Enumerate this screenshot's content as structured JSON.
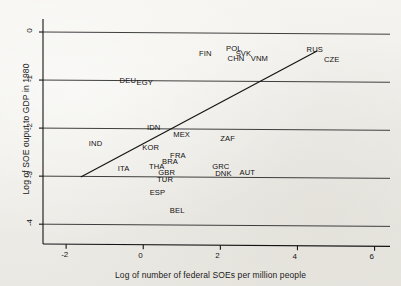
{
  "chart_data": {
    "type": "scatter",
    "title": "",
    "xlabel": "Log of number of federal SOEs per million people",
    "ylabel": "Log of SOE ouput to GDP in 1980",
    "xlim": [
      -2.6,
      6.4
    ],
    "ylim": [
      -4.35,
      0.25
    ],
    "xticks": [
      -2,
      0,
      2,
      4,
      6
    ],
    "xticklabels": [
      "-2",
      "0",
      "2",
      "4",
      "6"
    ],
    "yticks": [
      0,
      -1,
      -2,
      -3,
      -4
    ],
    "yticklabels": [
      "0",
      "-1",
      "-2",
      "-3",
      "-4"
    ],
    "grid": "horizontal",
    "legend": "none",
    "point_style": "text-label",
    "points": [
      {
        "label": "FIN",
        "x": 1.68,
        "y": -0.46
      },
      {
        "label": "POL",
        "x": 2.38,
        "y": -0.35
      },
      {
        "label": "SVK",
        "x": 2.63,
        "y": -0.45
      },
      {
        "label": "CHN",
        "x": 2.42,
        "y": -0.56
      },
      {
        "label": "VNM",
        "x": 3.02,
        "y": -0.56
      },
      {
        "label": "RUS",
        "x": 4.47,
        "y": -0.37
      },
      {
        "label": "CZE",
        "x": 4.92,
        "y": -0.58
      },
      {
        "label": "DEU",
        "x": -0.38,
        "y": -1.03
      },
      {
        "label": "EGY",
        "x": 0.06,
        "y": -1.06
      },
      {
        "label": "IDN",
        "x": 0.33,
        "y": -1.99
      },
      {
        "label": "MEX",
        "x": 1.01,
        "y": -2.15
      },
      {
        "label": "ZAF",
        "x": 2.23,
        "y": -2.23
      },
      {
        "label": "IND",
        "x": -1.18,
        "y": -2.33
      },
      {
        "label": "KOR",
        "x": 0.21,
        "y": -2.42
      },
      {
        "label": "FRA",
        "x": 0.93,
        "y": -2.58
      },
      {
        "label": "BRA",
        "x": 0.72,
        "y": -2.7
      },
      {
        "label": "THA",
        "x": 0.38,
        "y": -2.82
      },
      {
        "label": "ITA",
        "x": -0.43,
        "y": -2.86
      },
      {
        "label": "GRC",
        "x": 2.02,
        "y": -2.8
      },
      {
        "label": "GBR",
        "x": 0.62,
        "y": -2.93
      },
      {
        "label": "DNK",
        "x": 2.1,
        "y": -2.95
      },
      {
        "label": "AUT",
        "x": 2.73,
        "y": -2.93
      },
      {
        "label": "TUR",
        "x": 0.59,
        "y": -3.07
      },
      {
        "label": "ESP",
        "x": 0.4,
        "y": -3.36
      },
      {
        "label": "BEL",
        "x": 0.92,
        "y": -3.72
      }
    ],
    "fit_line": {
      "name": "linear fit",
      "x_start": -1.62,
      "y_start": -3.02,
      "x_end": 4.52,
      "y_end": -0.39
    },
    "colors": {
      "background": "#f1efe9",
      "ink": "#141414",
      "gridline": "#2a2a2a"
    }
  }
}
